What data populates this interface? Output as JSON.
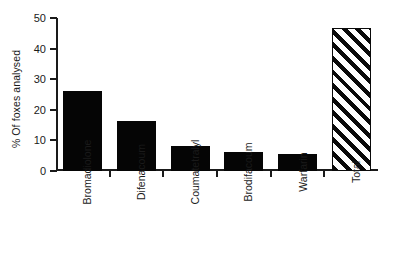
{
  "chart_data": {
    "type": "bar",
    "title": "",
    "subtitle": "",
    "xlabel": "",
    "ylabel": "% Of foxes analysed",
    "categories": [
      "Bromadiolone",
      "Difenacoum",
      "Coumatetralyl",
      "Brodifacoum",
      "Warfarin",
      "Total"
    ],
    "values": [
      26.3,
      16.5,
      8.2,
      6.3,
      5.4,
      46.7
    ],
    "series": [
      {
        "name": "% Of foxes analysed",
        "values": [
          26.3,
          16.5,
          8.2,
          6.3,
          5.4,
          46.7
        ]
      }
    ],
    "bar_styles": [
      "solid",
      "solid",
      "solid",
      "solid",
      "solid",
      "hatched"
    ],
    "ylim": [
      0,
      50
    ],
    "yticks": [
      0,
      10,
      20,
      30,
      40,
      50
    ],
    "ytick_labels": [
      "0",
      "10",
      "20",
      "30",
      "40",
      "50"
    ],
    "grid": false,
    "legend": "none",
    "bar_color": "#050505",
    "hatch_color": "#0a0a0a",
    "axis_color": "#1a1a1a",
    "background": "#ffffff",
    "annotations": []
  },
  "axis": {
    "y_title": "% Of foxes analysed"
  }
}
